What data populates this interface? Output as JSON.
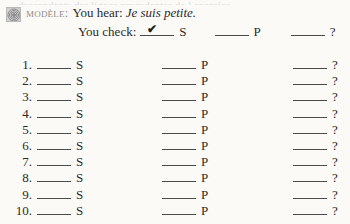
{
  "page": {
    "background_color": "#fbfaf7",
    "text_color": "#2b2b2b",
    "top_clipped_text": "descendants des lignes precedentes de l exercice"
  },
  "model": {
    "icon": "audio-speaker-icon",
    "label": "Modèle:",
    "label_color": "#8d8d8d",
    "hear_label": "You hear:",
    "hear_sentence": "Je suis petite.",
    "check_label": "You check:",
    "checkmark": "✔",
    "options": [
      {
        "key": "S",
        "checked": true
      },
      {
        "key": "P",
        "checked": false
      },
      {
        "key": "?",
        "checked": false
      }
    ]
  },
  "exercise": {
    "column_keys": [
      "S",
      "P",
      "?"
    ],
    "rows": [
      {
        "number": "1."
      },
      {
        "number": "2."
      },
      {
        "number": "3."
      },
      {
        "number": "4."
      },
      {
        "number": "5."
      },
      {
        "number": "6."
      },
      {
        "number": "7."
      },
      {
        "number": "8."
      },
      {
        "number": "9."
      },
      {
        "number": "10."
      }
    ]
  }
}
